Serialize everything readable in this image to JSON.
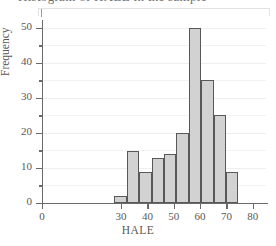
{
  "figure": {
    "clipped_title": "Histogram of HALE in the sample",
    "background_color": "#ffffff"
  },
  "chart_data": {
    "type": "bar",
    "title": "",
    "xlabel": "HALE",
    "ylabel": "Frequency",
    "xlim": [
      0,
      85
    ],
    "ylim": [
      0,
      51.7
    ],
    "grid": true,
    "legend": null,
    "bar_color": "#d2d2d2",
    "bar_edge_color": "#58585a",
    "xticks": [
      0,
      30,
      40,
      50,
      60,
      70,
      80
    ],
    "xtick_labels": [
      "0",
      "30",
      "40",
      "50",
      "60",
      "70",
      "80"
    ],
    "yticks": [
      0,
      10,
      20,
      30,
      40,
      50
    ],
    "ytick_labels": [
      "0",
      "10",
      "20",
      "30",
      "40",
      "50"
    ],
    "minor_yticks": [
      5,
      15,
      25,
      35,
      45
    ],
    "bin_edges": [
      27.5,
      32.2,
      36.9,
      41.6,
      46.3,
      51.0,
      55.7,
      60.4,
      65.1,
      69.8,
      74.5
    ],
    "categories": [
      "27.5-32.2",
      "32.2-36.9",
      "36.9-41.6",
      "41.6-46.3",
      "46.3-51.0",
      "51.0-55.7",
      "55.7-60.4",
      "60.4-65.1",
      "65.1-69.8",
      "69.8-74.5"
    ],
    "values": [
      2,
      15,
      9,
      13,
      14,
      20,
      50,
      35,
      25,
      9
    ]
  }
}
